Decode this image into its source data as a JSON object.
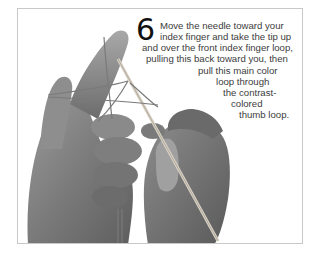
{
  "step": {
    "number": "6",
    "lines": [
      "Move the needle toward your",
      "index finger and take the tip up",
      "and over the front index finger loop,",
      "pulling this back toward you, then",
      "pull this main color",
      "loop through",
      "the contrast-",
      "colored",
      "thumb loop."
    ]
  },
  "image": {
    "description": "Grayscale photo of two hands holding a knitting needle with yarn loops over index finger and thumb"
  }
}
